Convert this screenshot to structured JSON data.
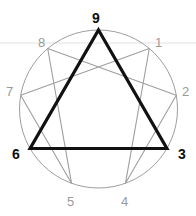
{
  "diagram": {
    "background_color": "#ffffff",
    "circle": {
      "cx": 98.5,
      "cy": 109,
      "r": 79,
      "stroke_color": "#9e9e9e",
      "stroke_width": 1
    },
    "faint_rule": {
      "y": 43,
      "color": "#f0f0f0",
      "stroke_width": 2
    },
    "colors": {
      "primary_stroke": "#111111",
      "secondary_stroke": "#9e9e9e",
      "primary_text": "#0d0d0d",
      "secondary_text": "#9a9a9a"
    },
    "points": [
      {
        "id": "p9",
        "label": "9",
        "emphasis": "primary",
        "angle_deg": 90,
        "x": 98.5,
        "y": 30.0,
        "label_x": 92,
        "label_y": 11
      },
      {
        "id": "p1",
        "label": "1",
        "emphasis": "secondary",
        "angle_deg": 50,
        "x": 149.3,
        "y": 48.5,
        "label_x": 155,
        "label_y": 36
      },
      {
        "id": "p2",
        "label": "2",
        "emphasis": "secondary",
        "angle_deg": 10,
        "x": 176.3,
        "y": 95.3,
        "label_x": 182,
        "label_y": 85
      },
      {
        "id": "p3",
        "label": "3",
        "emphasis": "primary",
        "angle_deg": -30,
        "x": 166.9,
        "y": 148.5,
        "label_x": 178,
        "label_y": 147
      },
      {
        "id": "p4",
        "label": "4",
        "emphasis": "secondary",
        "angle_deg": -70,
        "x": 125.5,
        "y": 183.2,
        "label_x": 121,
        "label_y": 195
      },
      {
        "id": "p5",
        "label": "5",
        "emphasis": "secondary",
        "angle_deg": -110,
        "x": 71.5,
        "y": 183.2,
        "label_x": 67,
        "label_y": 195
      },
      {
        "id": "p6",
        "label": "6",
        "emphasis": "primary",
        "angle_deg": -150,
        "x": 30.1,
        "y": 148.5,
        "label_x": 12,
        "label_y": 147
      },
      {
        "id": "p7",
        "label": "7",
        "emphasis": "secondary",
        "angle_deg": 170,
        "x": 20.7,
        "y": 95.3,
        "label_x": 6,
        "label_y": 85
      },
      {
        "id": "p8",
        "label": "8",
        "emphasis": "secondary",
        "angle_deg": 130,
        "x": 47.7,
        "y": 48.5,
        "label_x": 38,
        "label_y": 36
      }
    ],
    "triangle": {
      "name": "inner-triangle-9-3-6",
      "sequence": [
        "9",
        "3",
        "6"
      ],
      "emphasis": "primary",
      "stroke_color": "#111111",
      "stroke_width": 3.2,
      "closed": true
    },
    "hexad": {
      "name": "hexad-path-1-4-2-8-5-7",
      "sequence": [
        "1",
        "4",
        "2",
        "8",
        "5",
        "7"
      ],
      "emphasis": "secondary",
      "stroke_color": "#9e9e9e",
      "stroke_width": 1.1,
      "closed": true
    }
  }
}
